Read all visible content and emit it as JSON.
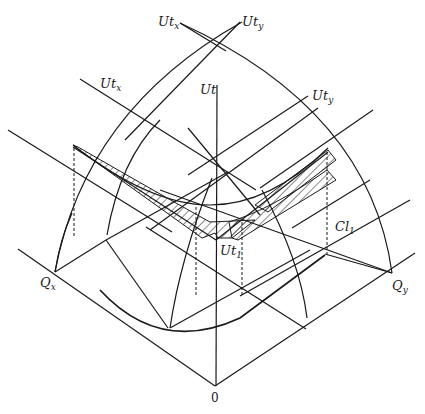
{
  "diagram": {
    "type": "three-dimensional utility surface diagram with isoquant projection",
    "labels": {
      "utx_top": {
        "main": "Ut",
        "sub": "x"
      },
      "uty_top": {
        "main": "Ut",
        "sub": "y"
      },
      "utx_mid": {
        "main": "Ut",
        "sub": "x"
      },
      "uty_mid": {
        "main": "Ut",
        "sub": "y"
      },
      "ut_axis": {
        "main": "Ut",
        "sub": ""
      },
      "ut1": {
        "main": "Ut",
        "sub": "1"
      },
      "cl1": {
        "main": "Cl",
        "sub": "1"
      },
      "qx": {
        "main": "Q",
        "sub": "x"
      },
      "qy": {
        "main": "Q",
        "sub": "y"
      },
      "origin": "0"
    },
    "colors": {
      "line": "#1a1a1a",
      "background": "#ffffff"
    }
  }
}
